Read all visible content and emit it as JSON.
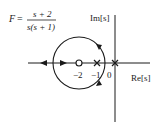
{
  "formula": {
    "lhs": "F",
    "equals": "=",
    "numerator": "s + 2",
    "denominator": "s(s + 1)"
  },
  "axes": {
    "imag_label": "Im[s]",
    "real_label": "Re[s]"
  },
  "tick_labels": {
    "zero": "−2",
    "pole1": "−1",
    "pole2": "0"
  },
  "markers": [
    {
      "type": "zero",
      "symbol": "o",
      "value": -2
    },
    {
      "type": "pole",
      "symbol": "x",
      "value": -1
    },
    {
      "type": "pole",
      "symbol": "x",
      "value": 0
    }
  ],
  "colors": {
    "stroke": "#1a1a1a",
    "background": "#ffffff"
  }
}
